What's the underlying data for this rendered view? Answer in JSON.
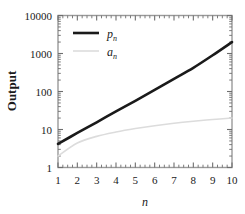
{
  "chart_data": {
    "type": "line",
    "title": "",
    "xlabel": "n",
    "ylabel": "Output",
    "xscale": "linear",
    "yscale": "log",
    "xlim": [
      1,
      10
    ],
    "ylim": [
      1,
      10000
    ],
    "grid": false,
    "legend_position": "top-left",
    "x": [
      1,
      2,
      3,
      4,
      5,
      6,
      7,
      8,
      9,
      10
    ],
    "xticks": [
      "1",
      "2",
      "3",
      "4",
      "5",
      "6",
      "7",
      "8",
      "9",
      "10"
    ],
    "yticks": [
      "1",
      "10",
      "100",
      "1000",
      "10000"
    ],
    "ytick_values": [
      1,
      10,
      100,
      1000,
      10000
    ],
    "series": [
      {
        "name": "p_n",
        "label_base": "p",
        "label_sub": "n",
        "color": "#1a1a1a",
        "linewidth": 2.6,
        "values": [
          4.2,
          8.1,
          15.5,
          30,
          57,
          110,
          215,
          420,
          900,
          2000
        ]
      },
      {
        "name": "a_n",
        "label_base": "a",
        "label_sub": "n",
        "color": "#dcdcdc",
        "linewidth": 1.6,
        "values": [
          2.0,
          4.4,
          6.6,
          8.6,
          10.6,
          12.6,
          14.6,
          16.5,
          18.3,
          20.0
        ]
      }
    ]
  },
  "axes": {
    "y_axis_label": "Output",
    "x_axis_label": "n",
    "y_tick_labels": [
      "10000",
      "1000",
      "100",
      "10",
      "1"
    ],
    "x_tick_labels": [
      "1",
      "2",
      "3",
      "4",
      "5",
      "6",
      "7",
      "8",
      "9",
      "10"
    ]
  },
  "legend": {
    "entries": [
      {
        "base": "p",
        "sub": "n",
        "swatch_color": "#1a1a1a"
      },
      {
        "base": "a",
        "sub": "n",
        "swatch_color": "#dcdcdc"
      }
    ]
  }
}
